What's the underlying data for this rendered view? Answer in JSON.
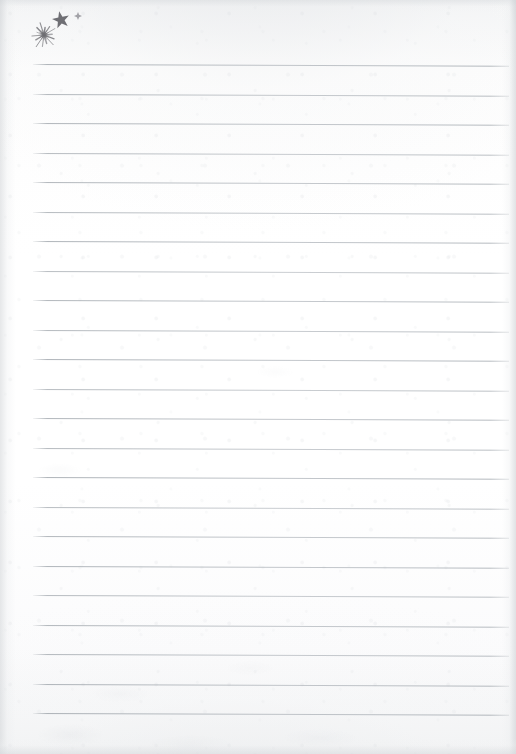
{
  "document": {
    "kind": "scanned-lined-notepaper",
    "title": "Blank Ruled Notepaper Scan",
    "orientation": "portrait",
    "width_px": 516,
    "height_px": 754,
    "body_text": "",
    "page_number": "",
    "paper": {
      "background_color": "#fdfdfd",
      "scan_edge_shadow_color": "#d1d4d7",
      "texture": "faint grey scan mottling with smudges along the lower area"
    },
    "ruling": {
      "line_color": "#a8aeb4",
      "line_thickness_px": 1,
      "line_count": 23,
      "first_line_y_px": 64,
      "line_spacing_px": 29.5,
      "left_margin_px": 33,
      "right_margin_px": 509,
      "slight_skew_deg": 0.22,
      "has_vertical_margin_rule": false
    },
    "annotations": {
      "count": 3,
      "ink_color": "#6e6e73",
      "description": "three hand-drawn star doodles clustered in the upper-left corner above the first ruled line",
      "items": [
        {
          "name": "starburst-doodle",
          "shape": "many-rayed starburst",
          "rays": 14,
          "center_x_px": 44,
          "center_y_px": 35,
          "radius_px": 13,
          "ink_color": "#6d6d72"
        },
        {
          "name": "five-point-star-doodle",
          "shape": "filled five-pointed star",
          "points": 5,
          "center_x_px": 61,
          "center_y_px": 20,
          "radius_px": 9,
          "rotation_deg": -12,
          "ink_color": "#636368"
        },
        {
          "name": "small-sparkle-doodle",
          "shape": "small four-point sparkle",
          "points": 4,
          "center_x_px": 78,
          "center_y_px": 16,
          "radius_px": 4,
          "ink_color": "#8d8d93"
        }
      ]
    }
  }
}
